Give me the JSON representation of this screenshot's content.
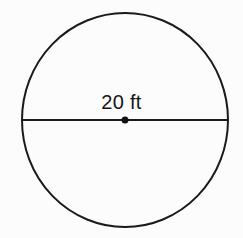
{
  "figure": {
    "kind": "circle-with-diameter",
    "background_color": "#fcfcfc",
    "stroke_color": "#1a1a1a",
    "label_color": "#161616",
    "circle": {
      "name": "circle-outline",
      "center_x": 125,
      "center_y": 120,
      "radius_x": 103,
      "radius_y": 107,
      "stroke_width": 2
    },
    "diameter": {
      "name": "diameter-segment",
      "x1": 22,
      "y1": 120,
      "x2": 228,
      "y2": 120,
      "stroke_width": 2
    },
    "center_point": {
      "name": "center-dot",
      "cx": 125,
      "cy": 120,
      "radius": 3.5
    },
    "measurement": {
      "value": "20",
      "unit": "ft",
      "text": "20 ft"
    }
  }
}
